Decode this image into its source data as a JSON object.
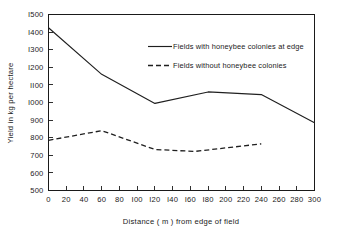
{
  "chart_data": {
    "type": "line",
    "title": "",
    "xlabel": "Distance ( m ) from edge of field",
    "ylabel": "Yield in kg per hectare",
    "xlim": [
      0,
      300
    ],
    "ylim": [
      500,
      1500
    ],
    "xticks": [
      0,
      20,
      40,
      60,
      80,
      100,
      120,
      140,
      160,
      180,
      200,
      220,
      240,
      260,
      280,
      300
    ],
    "xticklabels": [
      "0",
      "20",
      "40",
      "60",
      "80",
      "I00",
      "I20",
      "I40",
      "I60",
      "I80",
      "200",
      "220",
      "240",
      "260",
      "280",
      "300"
    ],
    "yticks": [
      500,
      600,
      700,
      800,
      900,
      1000,
      1100,
      1200,
      1300,
      1400,
      1500
    ],
    "yticklabels": [
      "500",
      "600",
      "700",
      "800",
      "900",
      "I000",
      "II00",
      "I200",
      "I300",
      "I400",
      "I500"
    ],
    "grid": false,
    "legend_position": "upper-center-right",
    "series": [
      {
        "name": "Fields with honeybee colonies at edge",
        "style": "solid",
        "color": "#1f1f1f",
        "x": [
          0,
          60,
          120,
          180,
          240,
          300
        ],
        "values": [
          1425,
          1160,
          995,
          1060,
          1045,
          885
        ]
      },
      {
        "name": "Fields without honeybee colonies",
        "style": "dashed",
        "color": "#1f1f1f",
        "x": [
          0,
          60,
          120,
          165,
          240
        ],
        "values": [
          785,
          840,
          733,
          722,
          765
        ]
      }
    ]
  },
  "legend": {
    "entries": [
      {
        "label": "Fields with honeybee colonies at edge",
        "style": "solid"
      },
      {
        "label": "Fields without honeybee colonies",
        "style": "dashed"
      }
    ]
  },
  "axes": {
    "x_title": "Distance ( m ) from edge of field",
    "y_title": "Yield in kg per hectare"
  }
}
